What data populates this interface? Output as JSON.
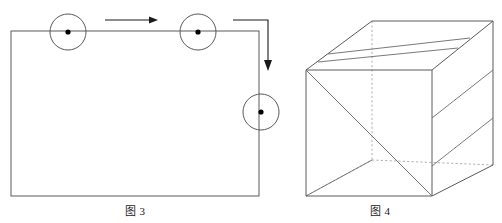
{
  "page": {
    "width": 502,
    "height": 223,
    "background": "#ffffff",
    "stroke_color": "#4a4a4a",
    "dark_stroke_color": "#1a1a1a",
    "dashed_stroke_color": "#9a9a9a",
    "dot_color": "#000000"
  },
  "figure_left": {
    "caption": "图 3",
    "name": "rectangular-loop-diagram",
    "rectangle": {
      "x": 11,
      "y": 31,
      "width": 248,
      "height": 165
    },
    "circles": [
      {
        "id": "circle-top-left",
        "cx": 68,
        "cy": 32,
        "r": 18,
        "dot_r": 2.6
      },
      {
        "id": "circle-top-right",
        "cx": 198,
        "cy": 32,
        "r": 18,
        "dot_r": 2.6
      },
      {
        "id": "circle-right",
        "cx": 261,
        "cy": 112,
        "r": 18,
        "dot_r": 2.6
      }
    ],
    "arrows": [
      {
        "id": "arrow-horizontal",
        "direction": "right",
        "x1": 105,
        "y1": 20,
        "x2": 155,
        "y2": 20
      },
      {
        "id": "arrow-elbow-down",
        "direction": "down",
        "path": "M233,20 L268,20 L268,68"
      }
    ]
  },
  "figure_right": {
    "caption": "图 4",
    "name": "cuboid-3d-diagram",
    "vertices": {
      "front_top_left": {
        "x": 306,
        "y": 70
      },
      "front_top_right": {
        "x": 432,
        "y": 70
      },
      "front_bottom_left": {
        "x": 306,
        "y": 196
      },
      "front_bottom_right": {
        "x": 432,
        "y": 196
      },
      "back_top_left": {
        "x": 372,
        "y": 21
      },
      "back_top_right": {
        "x": 493,
        "y": 21
      },
      "back_bottom_right": {
        "x": 493,
        "y": 165
      },
      "back_bottom_left": {
        "x": 372,
        "y": 160
      }
    },
    "top_face_lines": 2,
    "right_face_lines": 2,
    "hidden_edges_dashed": true
  }
}
